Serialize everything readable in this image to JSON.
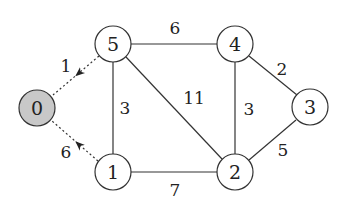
{
  "graph": {
    "nodes": [
      {
        "id": "0",
        "label": "0",
        "x": 37,
        "y": 108,
        "fill": "#c8c8c8"
      },
      {
        "id": "1",
        "label": "1",
        "x": 113,
        "y": 172,
        "fill": "#ffffff"
      },
      {
        "id": "2",
        "label": "2",
        "x": 235,
        "y": 172,
        "fill": "#ffffff"
      },
      {
        "id": "3",
        "label": "3",
        "x": 310,
        "y": 107,
        "fill": "#ffffff"
      },
      {
        "id": "4",
        "label": "4",
        "x": 235,
        "y": 44,
        "fill": "#ffffff"
      },
      {
        "id": "5",
        "label": "5",
        "x": 113,
        "y": 44,
        "fill": "#ffffff"
      }
    ],
    "edges": [
      {
        "from": "5",
        "to": "4",
        "weight": "6",
        "style": "solid",
        "directed": false
      },
      {
        "from": "5",
        "to": "1",
        "weight": "3",
        "style": "solid",
        "directed": false
      },
      {
        "from": "5",
        "to": "2",
        "weight": "11",
        "style": "solid",
        "directed": false
      },
      {
        "from": "4",
        "to": "2",
        "weight": "3",
        "style": "solid",
        "directed": false
      },
      {
        "from": "4",
        "to": "3",
        "weight": "2",
        "style": "solid",
        "directed": false
      },
      {
        "from": "2",
        "to": "3",
        "weight": "5",
        "style": "solid",
        "directed": false
      },
      {
        "from": "1",
        "to": "2",
        "weight": "7",
        "style": "solid",
        "directed": false
      },
      {
        "from": "5",
        "to": "0",
        "weight": "1",
        "style": "dotted",
        "directed": true
      },
      {
        "from": "1",
        "to": "0",
        "weight": "6",
        "style": "dotted",
        "directed": true
      }
    ]
  }
}
